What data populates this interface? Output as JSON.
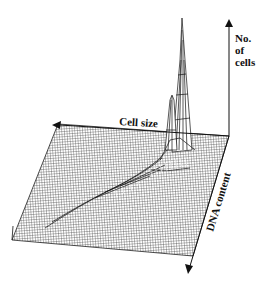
{
  "figure": {
    "type": "3D surface plot (flow cytometry histogram)",
    "axes": {
      "vertical": {
        "label_lines": [
          "No.",
          "of",
          "cells"
        ]
      },
      "left": {
        "label": "Cell size"
      },
      "depth": {
        "label": "DNA content"
      }
    },
    "features": [
      {
        "name": "main-peak",
        "description": "tall narrow spike near back-right corner"
      },
      {
        "name": "secondary-peak",
        "description": "smaller spike left of main peak"
      },
      {
        "name": "ridge",
        "description": "curved ridge of raised cells sweeping from peak toward front-left"
      }
    ],
    "colors": {
      "ink": "#111111",
      "background": "#ffffff"
    }
  }
}
